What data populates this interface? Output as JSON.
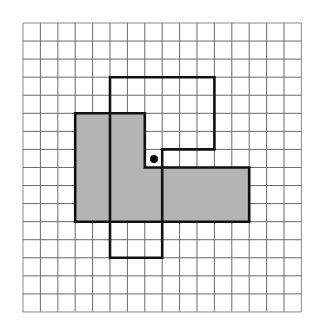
{
  "diagram": {
    "type": "grid-transformation",
    "grid": {
      "columns": 16,
      "rows": 16,
      "origin_px": [
        23,
        23
      ],
      "cell_w": 17.4,
      "cell_h": 18.06,
      "line_color": "#6b6b6b",
      "border_color": "#8a8a8a"
    },
    "shapes": [
      {
        "name": "shaded-shape",
        "fill": "#b4b4b4",
        "stroke": "#111111",
        "vertices": [
          [
            3,
            5
          ],
          [
            7,
            5
          ],
          [
            7,
            8
          ],
          [
            13,
            8
          ],
          [
            13,
            11
          ],
          [
            3,
            11
          ]
        ]
      },
      {
        "name": "outlined-shape",
        "fill": "none",
        "stroke": "#111111",
        "vertices": [
          [
            5,
            3
          ],
          [
            11,
            3
          ],
          [
            11,
            7
          ],
          [
            8,
            7
          ],
          [
            8,
            13
          ],
          [
            5,
            13
          ]
        ]
      }
    ],
    "center_point": {
      "name": "rotation-center-dot",
      "x_px": 154,
      "y_px": 159,
      "radius": 4,
      "color": "#000000"
    }
  }
}
